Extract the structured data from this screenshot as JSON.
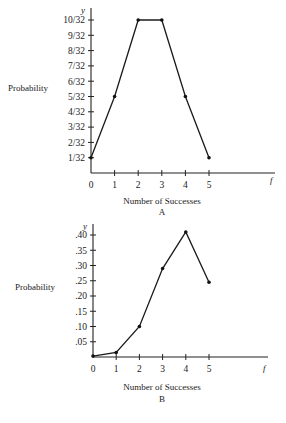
{
  "chart_data": [
    {
      "type": "line",
      "title": "",
      "caption": "A",
      "xlabel": "Number of Successes",
      "ylabel": "Probability",
      "x_var": "f",
      "y_var": "y",
      "x": [
        0,
        1,
        2,
        3,
        4,
        5
      ],
      "x_tick_labels": [
        "0",
        "1",
        "2",
        "3",
        "4",
        "5"
      ],
      "values": [
        0.03125,
        0.15625,
        0.3125,
        0.3125,
        0.15625,
        0.03125
      ],
      "values_label": [
        "1/32",
        "5/32",
        "10/32",
        "10/32",
        "5/32",
        "1/32"
      ],
      "y_ticks": [
        0.03125,
        0.0625,
        0.09375,
        0.125,
        0.15625,
        0.1875,
        0.21875,
        0.25,
        0.28125,
        0.3125
      ],
      "y_tick_labels": [
        "1/32",
        "2/32",
        "3/32",
        "4/32",
        "5/32",
        "6/32",
        "7/32",
        "8/32",
        "9/32",
        "10/32"
      ],
      "ylim": [
        0,
        0.3125
      ],
      "grid": false,
      "legend": "none"
    },
    {
      "type": "line",
      "title": "",
      "caption": "B",
      "xlabel": "Number of Successes",
      "ylabel": "Probability",
      "x_var": "f",
      "y_var": "y",
      "x": [
        0,
        1,
        2,
        3,
        4,
        5
      ],
      "x_tick_labels": [
        "0",
        "1",
        "2",
        "3",
        "4",
        "5"
      ],
      "values": [
        0.003,
        0.015,
        0.1,
        0.29,
        0.41,
        0.245
      ],
      "y_ticks": [
        0.05,
        0.1,
        0.15,
        0.2,
        0.25,
        0.3,
        0.35,
        0.4
      ],
      "y_tick_labels": [
        ".05",
        ".10",
        ".15",
        ".20",
        ".25",
        ".30",
        ".35",
        ".40"
      ],
      "ylim": [
        0,
        0.4
      ],
      "grid": false,
      "legend": "none"
    }
  ],
  "layout": [
    {
      "origin_x": 91,
      "origin_y": 173,
      "x_step": 23.6,
      "y_top_px": 20,
      "y_top_val": 0.3125,
      "axis_end_x": 275,
      "axis_top_y": 8,
      "f_x": 270,
      "f_y": 183,
      "ylabel_x": 8,
      "ylabel_y": 91,
      "xlabel_y": 204,
      "caption_y": 215
    },
    {
      "origin_x": 93,
      "origin_y": 357,
      "x_step": 23.2,
      "y_top_px": 235,
      "y_top_val": 0.4,
      "axis_end_x": 268,
      "axis_top_y": 224,
      "f_x": 263,
      "f_y": 371,
      "ylabel_x": 15,
      "ylabel_y": 290,
      "xlabel_y": 390,
      "caption_y": 402
    }
  ]
}
